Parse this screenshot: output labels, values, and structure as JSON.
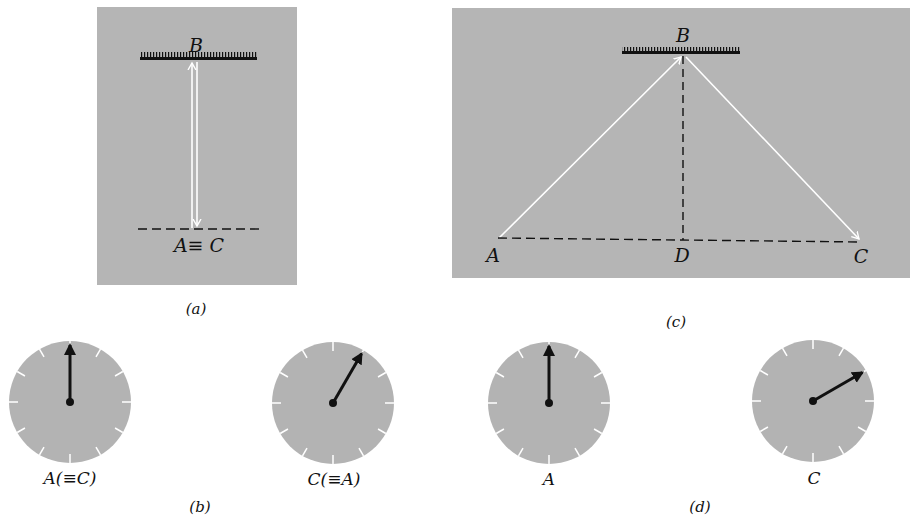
{
  "colors": {
    "panel_bg": "#b5b5b5",
    "clock_face": "#b3b3b3",
    "ray": "#ffffff",
    "ink": "#111111",
    "tick": "#ffffff"
  },
  "panel_a": {
    "caption": "(a)",
    "mirror_label": "B",
    "base_label": "A≡ C"
  },
  "panel_c": {
    "caption": "(c)",
    "mirror_label": "B",
    "point_a": "A",
    "point_d": "D",
    "point_c": "C"
  },
  "panel_b": {
    "caption": "(b)",
    "clocks": [
      {
        "label": "A(≡C)",
        "hand_angle_deg": 0
      },
      {
        "label": "C(≡A)",
        "hand_angle_deg": 30
      }
    ]
  },
  "panel_d": {
    "caption": "(d)",
    "clocks": [
      {
        "label": "A",
        "hand_angle_deg": 0
      },
      {
        "label": "C",
        "hand_angle_deg": 60
      }
    ]
  }
}
